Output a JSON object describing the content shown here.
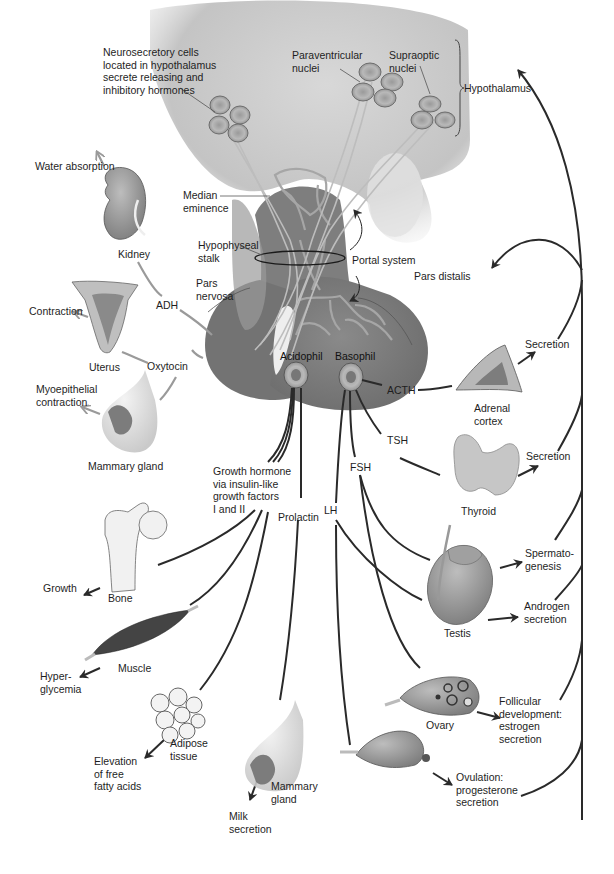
{
  "diagram": {
    "topic": "Hypothalamic-pituitary hormone targets",
    "colors": {
      "hypothalamus_fill": "#c9c9c9",
      "pituitary_fill": "#7a7a7a",
      "pituitary_dark": "#666666",
      "vessel": "#8c8c8c",
      "axon": "#b5b5b5",
      "pathway_line": "#2a2a2a",
      "gray_arrow": "#9a9a9a",
      "organ": "#8f8f8f"
    },
    "hypothalamus": {
      "neurosecretory": "Neurosecretory cells\nlocated in hypothalamus\nsecrete releasing and\ninhibitory hormones",
      "paraventricular": "Paraventricular\nnuclei",
      "supraoptic": "Supraoptic\nnuclei",
      "bracket_label": "Hypothalamus"
    },
    "pituitary": {
      "median_eminence": "Median\neminence",
      "hypophyseal_stalk": "Hypophyseal\nstalk",
      "portal_system": "Portal system",
      "pars_distalis": "Pars distalis",
      "pars_nervosa": "Pars\nnervosa",
      "acidophil": "Acidophil",
      "basophil": "Basophil"
    },
    "posterior_hormones": {
      "adh": "ADH",
      "oxytocin": "Oxytocin"
    },
    "posterior_targets": [
      {
        "organ": "Kidney",
        "effect": "Water absorption"
      },
      {
        "organ": "Uterus",
        "effect": "Contraction"
      },
      {
        "organ": "Mammary gland",
        "effect": "Myoepithelial\ncontraction"
      }
    ],
    "anterior_hormones": {
      "growth_hormone": "Growth hormone\nvia insulin-like\ngrowth factors\nI and II",
      "prolactin": "Prolactin",
      "lh": "LH",
      "fsh": "FSH",
      "tsh": "TSH",
      "acth": "ACTH"
    },
    "anterior_targets": [
      {
        "organ": "Bone",
        "effect": "Growth"
      },
      {
        "organ": "Muscle",
        "effect": "Hyper-\nglycemia"
      },
      {
        "organ": "Adipose\ntissue",
        "effect": "Elevation\nof free\nfatty acids"
      },
      {
        "organ": "Mammary\ngland",
        "effect": "Milk\nsecretion"
      },
      {
        "organ": "Adrenal\ncortex",
        "effect": "Secretion"
      },
      {
        "organ": "Thyroid",
        "effect": "Secretion"
      },
      {
        "organ": "Testis",
        "effect_1": "Spermato-\ngenesis",
        "effect_2": "Androgen\nsecretion"
      },
      {
        "organ": "Ovary",
        "effect_1": "Follicular\ndevelopment:\nestrogen\nsecretion",
        "effect_2": "Ovulation:\nprogesterone\nsecretion"
      }
    ]
  }
}
